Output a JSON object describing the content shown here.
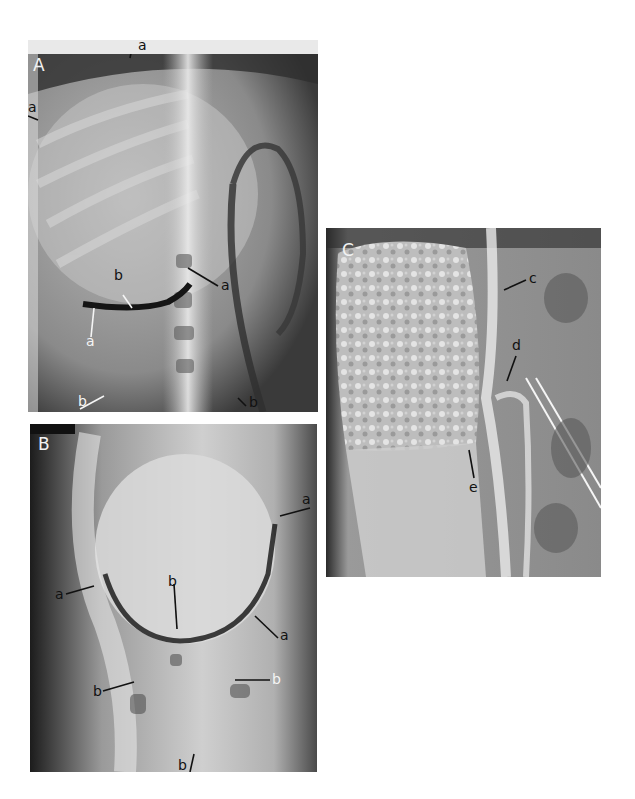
{
  "figure": {
    "panels": [
      {
        "id": "A",
        "label": "A",
        "annotations": [
          {
            "text": "a",
            "position": "top, arrow pointing down at upper margin"
          },
          {
            "text": "a",
            "position": "left edge, arrow pointing right"
          },
          {
            "text": "a",
            "position": "center-right, arrow pointing left at curved border"
          },
          {
            "text": "b",
            "position": "center-left, white arrow pointing down"
          },
          {
            "text": "a",
            "position": "lower-left, white arrow pointing up"
          },
          {
            "text": "b",
            "position": "bottom-left, white arrow pointing up-right"
          },
          {
            "text": "b",
            "position": "bottom-right, arrow pointing up-left"
          }
        ]
      },
      {
        "id": "B",
        "label": "B",
        "annotations": [
          {
            "text": "a",
            "position": "upper-right, arrow pointing left"
          },
          {
            "text": "a",
            "position": "left, arrow pointing right"
          },
          {
            "text": "b",
            "position": "center, arrow pointing down"
          },
          {
            "text": "a",
            "position": "right, arrow pointing up-left"
          },
          {
            "text": "b",
            "position": "lower-left, arrow pointing right"
          },
          {
            "text": "b",
            "position": "lower-right, arrow pointing left"
          },
          {
            "text": "b",
            "position": "bottom center, arrow pointing up"
          }
        ]
      },
      {
        "id": "C",
        "label": "C",
        "annotations": [
          {
            "text": "c",
            "position": "upper-right, arrow pointing left"
          },
          {
            "text": "d",
            "position": "center-right, arrow pointing down"
          },
          {
            "text": "e",
            "position": "lower-center, arrow pointing up"
          }
        ]
      }
    ]
  }
}
